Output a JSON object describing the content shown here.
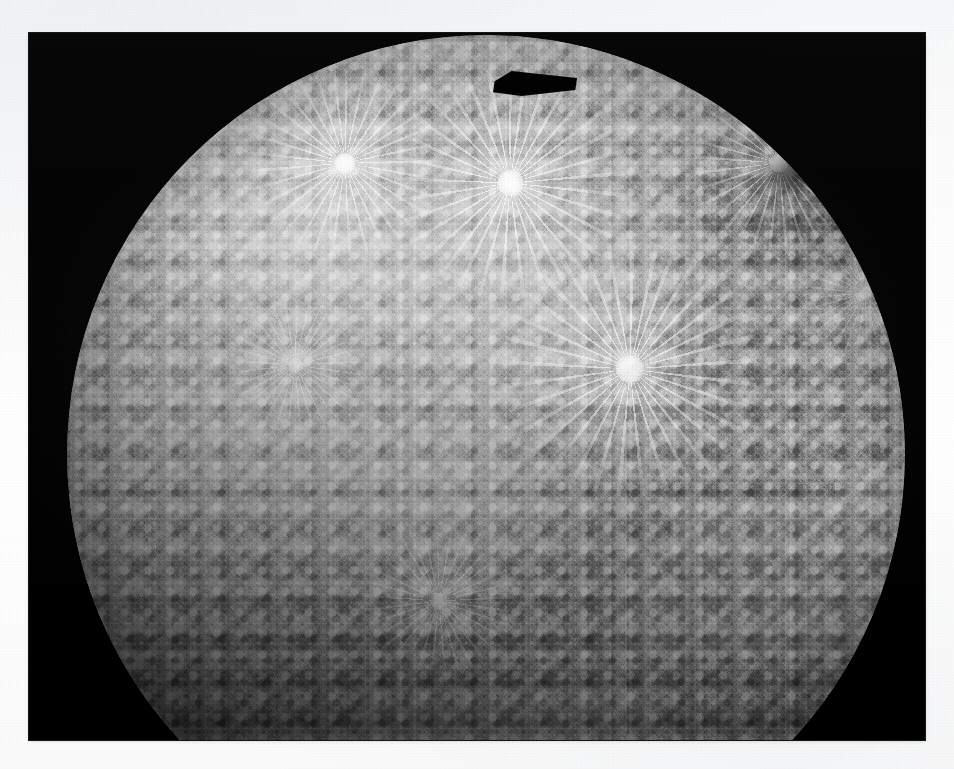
{
  "image": {
    "kind": "photograph",
    "subject": "Mercury",
    "mission": "Mariner 10",
    "view": "incoming-hemisphere photomosaic",
    "color_mode": "grayscale",
    "caption": "",
    "alt_text": "Black-and-white spacecraft photomosaic of the planet Mercury showing a heavily cratered hemisphere"
  },
  "frame": {
    "paper_color": "#fbfbfb",
    "photo_background": "#040404",
    "x": 29,
    "y": 33,
    "width": 896,
    "height": 707,
    "margin_left": 29,
    "margin_top": 33,
    "margin_right": 29,
    "margin_bottom": 29
  },
  "disk": {
    "name": "mercury-disk",
    "center_x": 457,
    "center_y": 421,
    "radius": 419,
    "base_tone": "#8d8d8d",
    "highlight_tone": "#d6d6d6",
    "shadow_tone": "#2a2a2a",
    "terminator": "lower-left / bottom limb in shadow",
    "illumination": "sun from upper left"
  },
  "features": {
    "rayed_craters": [
      {
        "name": "rayed-crater-upper-left",
        "x": 278,
        "y": 128,
        "size": 188,
        "intensity": 0.95
      },
      {
        "name": "rayed-crater-upper-center",
        "x": 443,
        "y": 148,
        "size": 232,
        "intensity": 1.0
      },
      {
        "name": "rayed-crater-upper-right",
        "x": 712,
        "y": 128,
        "size": 170,
        "intensity": 0.85
      },
      {
        "name": "rayed-crater-center",
        "x": 563,
        "y": 334,
        "size": 256,
        "intensity": 0.9
      },
      {
        "name": "rayed-crater-mid-left",
        "x": 228,
        "y": 330,
        "size": 132,
        "intensity": 0.6
      },
      {
        "name": "rayed-crater-lower-center",
        "x": 372,
        "y": 566,
        "size": 150,
        "intensity": 0.62
      },
      {
        "name": "rayed-crater-right",
        "x": 798,
        "y": 258,
        "size": 120,
        "intensity": 0.5
      }
    ],
    "dark_terrain_patches": [
      {
        "name": "dark-patch-upper-right",
        "x": 728,
        "y": 136,
        "width": 78,
        "height": 46
      },
      {
        "name": "dark-patch-right-limb",
        "x": 838,
        "y": 196,
        "width": 62,
        "height": 58
      }
    ],
    "mosaic_seams": [
      {
        "name": "seam-patch-right-upper",
        "x": 806,
        "y": 457,
        "width": 124,
        "height": 34,
        "tone": "lighter",
        "opacity": 0.17
      },
      {
        "name": "seam-patch-right-lower",
        "x": 642,
        "y": 489,
        "width": 286,
        "height": 52,
        "tone": "lighter",
        "opacity": 0.13
      },
      {
        "name": "seam-patch-right-band",
        "x": 596,
        "y": 537,
        "width": 320,
        "height": 104,
        "tone": "lighter",
        "opacity": 0.09
      },
      {
        "name": "seam-patch-bottom-band",
        "x": 330,
        "y": 676,
        "width": 300,
        "height": 58,
        "tone": "lighter",
        "opacity": 0.08
      },
      {
        "name": "seam-line-vertical",
        "x": 596,
        "y": 430,
        "width": 2,
        "height": 290,
        "tone": "lighter",
        "opacity": 0.12
      }
    ],
    "data_gap_notch": {
      "name": "data-gap-notch",
      "x": 464,
      "y": 37,
      "width": 84,
      "height": 27,
      "tone": "#020202",
      "description": "black wedge-shaped data gap along the top limb of the mosaic"
    }
  }
}
